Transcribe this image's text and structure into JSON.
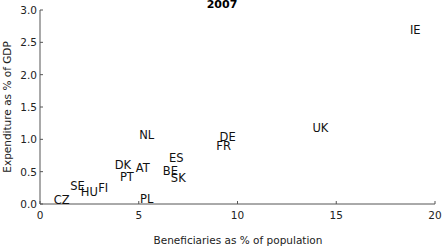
{
  "chart_data": {
    "type": "scatter",
    "title": "2007",
    "xlabel": "Beneficiaries as % of population",
    "ylabel": "Expenditure as % of GDP",
    "xlim": [
      0,
      20
    ],
    "ylim": [
      0,
      3.0
    ],
    "xticks": [
      0,
      5,
      10,
      15,
      20
    ],
    "xtick_labels": [
      "0",
      "5",
      "10",
      "15",
      "20"
    ],
    "yticks": [
      0.0,
      0.5,
      1.0,
      1.5,
      2.0,
      2.5,
      3.0
    ],
    "ytick_labels": [
      "0.0",
      "0.5",
      "1.0",
      "1.5",
      "2.0",
      "2.5",
      "3.0"
    ],
    "grid": false,
    "legend": null,
    "marker": "text-label",
    "points": [
      {
        "label": "CZ",
        "x": 1.1,
        "y": 0.06
      },
      {
        "label": "SE",
        "x": 1.9,
        "y": 0.28
      },
      {
        "label": "HU",
        "x": 2.5,
        "y": 0.19
      },
      {
        "label": "FI",
        "x": 3.2,
        "y": 0.25
      },
      {
        "label": "PL",
        "x": 5.4,
        "y": 0.08
      },
      {
        "label": "PT",
        "x": 4.4,
        "y": 0.42
      },
      {
        "label": "DK",
        "x": 4.2,
        "y": 0.6
      },
      {
        "label": "AT",
        "x": 5.2,
        "y": 0.56
      },
      {
        "label": "NL",
        "x": 5.4,
        "y": 1.07
      },
      {
        "label": "ES",
        "x": 6.9,
        "y": 0.71
      },
      {
        "label": "BE",
        "x": 6.6,
        "y": 0.51
      },
      {
        "label": "SK",
        "x": 7.0,
        "y": 0.4
      },
      {
        "label": "DE",
        "x": 9.5,
        "y": 1.04
      },
      {
        "label": "FR",
        "x": 9.3,
        "y": 0.9
      },
      {
        "label": "UK",
        "x": 14.2,
        "y": 1.17
      },
      {
        "label": "IE",
        "x": 19.0,
        "y": 2.69
      }
    ]
  }
}
